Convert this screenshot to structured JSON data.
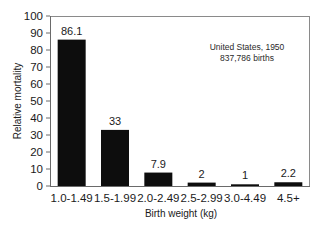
{
  "chart_data": {
    "type": "bar",
    "title": "",
    "xlabel": "Birth weight (kg)",
    "ylabel": "Relative mortality",
    "categories": [
      "1.0-1.49",
      "1.5-1.99",
      "2.0-2.49",
      "2.5-2.99",
      "3.0-4.49",
      "4.5+"
    ],
    "values": [
      86.1,
      33,
      7.9,
      2,
      1,
      2.2
    ],
    "data_labels": [
      "86.1",
      "33",
      "7.9",
      "2",
      "1",
      "2.2"
    ],
    "ylim": [
      0,
      100
    ],
    "yticks": [
      0,
      10,
      20,
      30,
      40,
      50,
      60,
      70,
      80,
      90,
      100
    ],
    "grid": false,
    "bar_color": "#0d0d0d",
    "annotations": [
      "United States, 1950",
      "837,786 births"
    ],
    "annotation_placement": "top-right"
  }
}
